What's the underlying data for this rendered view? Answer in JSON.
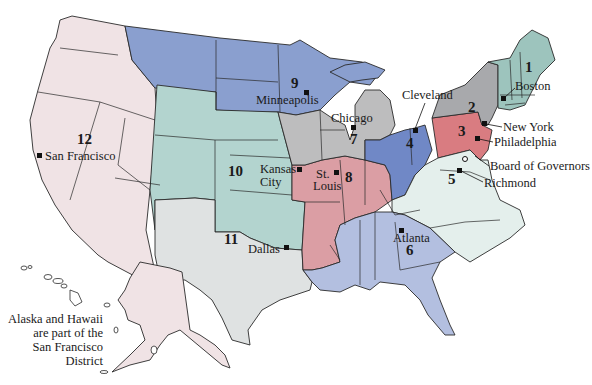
{
  "map": {
    "title": "Federal Reserve Districts",
    "colors": {
      "d1": "#9dc4bd",
      "d2": "#a8a9ac",
      "d3": "#d97c81",
      "d4": "#7088c6",
      "d5": "#e4efec",
      "d6": "#b3bfe0",
      "d7": "#bdbdbe",
      "d8": "#db9ea4",
      "d9": "#8a9fcf",
      "d10": "#b3d4cf",
      "d11": "#dfe2e2",
      "d12": "#f0e3e5"
    },
    "districts": [
      {
        "number": "1",
        "city": "Boston"
      },
      {
        "number": "2",
        "city": "New York"
      },
      {
        "number": "3",
        "city": "Philadelphia"
      },
      {
        "number": "4",
        "city": "Cleveland"
      },
      {
        "number": "5",
        "city": "Richmond"
      },
      {
        "number": "6",
        "city": "Atlanta"
      },
      {
        "number": "7",
        "city": "Chicago"
      },
      {
        "number": "8",
        "city_line1": "St.",
        "city_line2": "Louis"
      },
      {
        "number": "9",
        "city": "Minneapolis"
      },
      {
        "number": "10",
        "city_line1": "Kansas",
        "city_line2": "City"
      },
      {
        "number": "11",
        "city": "Dallas"
      },
      {
        "number": "12",
        "city": "San Francisco"
      }
    ],
    "board_label": "Board of Governors",
    "note": {
      "line1": "Alaska and Hawaii",
      "line2": "are part of the",
      "line3": "San Francisco District"
    }
  }
}
